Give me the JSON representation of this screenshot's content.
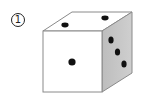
{
  "figure": {
    "label": "1",
    "faces": {
      "front": {
        "pips": 1,
        "fill": "#ffffff"
      },
      "top": {
        "pips": 2,
        "fill": "#ffffff"
      },
      "right": {
        "pips": 3,
        "fill": "#c6c6c6"
      }
    },
    "colors": {
      "outline": "#8a8a8a",
      "pip": "#111111"
    }
  }
}
